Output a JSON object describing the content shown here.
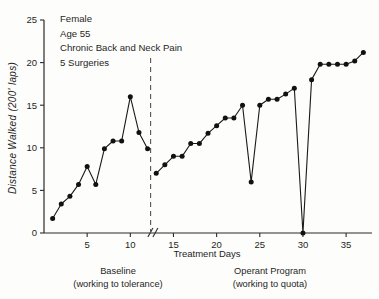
{
  "chart_data": {
    "type": "line",
    "title": "",
    "xlabel": "Treatment  Days",
    "ylabel": "Distance Walked  (200' laps)",
    "xlim": [
      0,
      38
    ],
    "ylim": [
      0,
      25
    ],
    "yticks": [
      0,
      5,
      10,
      15,
      20,
      25
    ],
    "ytick_labels": [
      "0",
      "5",
      "10",
      "15",
      "20",
      "25"
    ],
    "xticks": [
      5,
      10,
      15,
      20,
      25,
      30,
      35
    ],
    "xtick_labels": [
      "5",
      "10",
      "15",
      "20",
      "25",
      "30",
      "35"
    ],
    "grid": false,
    "legend": "none",
    "axis_break_at": 12.5,
    "phase_divider_x": 12.35,
    "series": [
      {
        "name": "Baseline",
        "x": [
          1,
          2,
          3,
          4,
          5,
          6,
          7,
          8,
          9,
          10,
          11,
          12
        ],
        "values": [
          1.7,
          3.4,
          4.3,
          5.7,
          7.8,
          5.7,
          9.9,
          10.8,
          10.8,
          16.0,
          11.8,
          9.9
        ]
      },
      {
        "name": "Operant Program",
        "x": [
          13,
          14,
          15,
          16,
          17,
          18,
          19,
          20,
          21,
          22,
          23,
          24,
          25,
          26,
          27,
          28,
          29,
          30,
          31,
          32,
          33,
          34,
          35,
          36,
          37
        ],
        "values": [
          7.0,
          8.0,
          9.0,
          9.0,
          10.5,
          10.5,
          11.7,
          12.6,
          13.5,
          13.5,
          15.0,
          6.0,
          15.0,
          15.7,
          15.7,
          16.3,
          17.0,
          0.0,
          18.0,
          19.8,
          19.8,
          19.8,
          19.8,
          20.2,
          21.2
        ]
      }
    ]
  },
  "annotation": {
    "lines": [
      "Female",
      "Age 55",
      "Chronic Back and Neck Pain",
      "5  Surgeries"
    ]
  },
  "phase_captions": {
    "baseline": {
      "title": "Baseline",
      "subtitle": "(working to tolerance)"
    },
    "operant": {
      "title": "Operant  Program",
      "subtitle": "(working to quota)"
    }
  },
  "colors": {
    "line": "#1a1a1a",
    "point": "#111111",
    "axis": "#2b2b2b",
    "divider": "#555555",
    "background": "#fdfdfb"
  }
}
